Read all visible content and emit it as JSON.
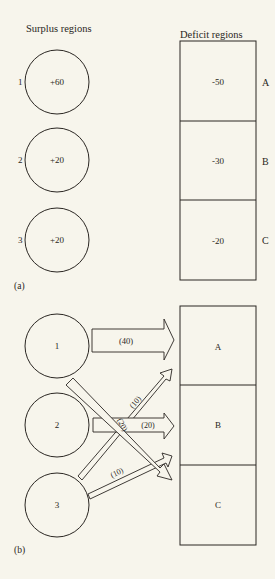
{
  "part_a": {
    "label": "(a)",
    "surplus_heading": "Surplus regions",
    "deficit_heading": "Deficit regions",
    "surplus": [
      {
        "id": "1",
        "value": "+60"
      },
      {
        "id": "2",
        "value": "+20"
      },
      {
        "id": "3",
        "value": "+20"
      }
    ],
    "deficit": [
      {
        "id": "A",
        "value": "-50"
      },
      {
        "id": "B",
        "value": "-30"
      },
      {
        "id": "C",
        "value": "-20"
      }
    ]
  },
  "part_b": {
    "label": "(b)",
    "sources": [
      {
        "id": "1"
      },
      {
        "id": "2"
      },
      {
        "id": "3"
      }
    ],
    "sinks": [
      {
        "id": "A"
      },
      {
        "id": "B"
      },
      {
        "id": "C"
      }
    ],
    "flows": [
      {
        "from": "1",
        "to": "A",
        "label": "(40)"
      },
      {
        "from": "1",
        "to": "C",
        "label": "(20)"
      },
      {
        "from": "2",
        "to": "B",
        "label": "(20)"
      },
      {
        "from": "3",
        "to": "A",
        "label": "(10)"
      },
      {
        "from": "3",
        "to": "B",
        "label": "(10)"
      }
    ]
  },
  "colors": {
    "line": "#2a2622",
    "background": "#f7f5ec",
    "fill": "#f7f5ec"
  }
}
